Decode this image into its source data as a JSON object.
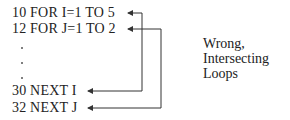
{
  "code_lines": [
    {
      "text": "10 FOR I=1 TO 5"
    },
    {
      "text": "12 FOR J=1 TO 2"
    },
    {
      "text": "30 NEXT I"
    },
    {
      "text": "32 NEXT J"
    }
  ],
  "ellipsis_dots": 3,
  "annotation": {
    "lines": [
      "Wrong,",
      "Intersecting",
      "Loops"
    ]
  }
}
